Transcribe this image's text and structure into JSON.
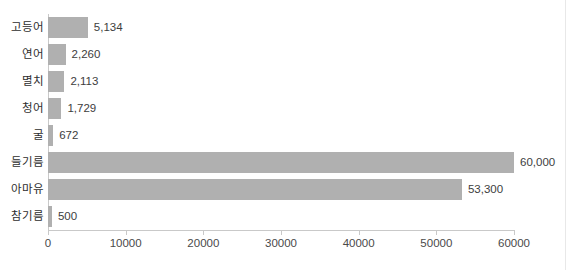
{
  "chart_data": {
    "type": "bar",
    "orientation": "horizontal",
    "title": "",
    "subtitle": "",
    "xlabel": "",
    "ylabel": "",
    "xlim": [
      0,
      60000
    ],
    "grid": false,
    "legend": false,
    "bar_color": "#b0b0b0",
    "axis_color": "#c9c9c9",
    "text_color": "#2e2e2e",
    "xticks": [
      0,
      10000,
      20000,
      30000,
      40000,
      50000,
      60000
    ],
    "xtick_labels": [
      "0",
      "10000",
      "20000",
      "30000",
      "40000",
      "50000",
      "60000"
    ],
    "categories": [
      "고등어",
      "연어",
      "멸치",
      "청어",
      "굴",
      "들기름",
      "아마유",
      "참기름"
    ],
    "values": [
      5134,
      2260,
      2113,
      1729,
      672,
      60000,
      53300,
      500
    ],
    "value_labels": [
      "5,134",
      "2,260",
      "2,113",
      "1,729",
      "672",
      "60,000",
      "53,300",
      "500"
    ],
    "rows": [
      {
        "category": "고등어",
        "value": 5134,
        "label": "5,134"
      },
      {
        "category": "연어",
        "value": 2260,
        "label": "2,260"
      },
      {
        "category": "멸치",
        "value": 2113,
        "label": "2,113"
      },
      {
        "category": "청어",
        "value": 1729,
        "label": "1,729"
      },
      {
        "category": "굴",
        "value": 672,
        "label": "672"
      },
      {
        "category": "들기름",
        "value": 60000,
        "label": "60,000"
      },
      {
        "category": "아마유",
        "value": 53300,
        "label": "53,300"
      },
      {
        "category": "참기름",
        "value": 500,
        "label": "500"
      }
    ]
  }
}
